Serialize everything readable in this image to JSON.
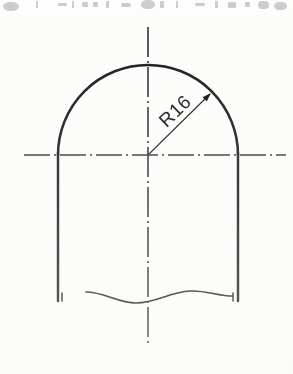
{
  "document": {
    "kind": "engineering-drawing",
    "medium": "scanned-paper",
    "paper_color": "#fdfdfc",
    "ink_color": "#1a1a1a",
    "centerline_color": "#2b2b2b",
    "artifact_color": "#8d8d93"
  },
  "scan_artifact": {
    "description": "cut-off bottom edge of a line of printed text from the page above",
    "visible": true,
    "marks": [
      {
        "x": 3,
        "y": 2,
        "w": 16,
        "h": 9,
        "r": 7
      },
      {
        "x": 36,
        "y": 1,
        "w": 2,
        "h": 7,
        "r": 0
      },
      {
        "x": 58,
        "y": 3,
        "w": 9,
        "h": 3,
        "r": 1
      },
      {
        "x": 72,
        "y": 1,
        "w": 2,
        "h": 7,
        "r": 0
      },
      {
        "x": 82,
        "y": 2,
        "w": 6,
        "h": 5,
        "r": 1
      },
      {
        "x": 93,
        "y": 2,
        "w": 5,
        "h": 5,
        "r": 1
      },
      {
        "x": 106,
        "y": 1,
        "w": 3,
        "h": 7,
        "r": 0
      },
      {
        "x": 121,
        "y": 3,
        "w": 10,
        "h": 4,
        "r": 2
      },
      {
        "x": 141,
        "y": 0,
        "w": 14,
        "h": 9,
        "r": 6
      },
      {
        "x": 160,
        "y": 1,
        "w": 4,
        "h": 7,
        "r": 1
      },
      {
        "x": 176,
        "y": 1,
        "w": 2,
        "h": 7,
        "r": 0
      },
      {
        "x": 195,
        "y": 3,
        "w": 10,
        "h": 3,
        "r": 1
      },
      {
        "x": 215,
        "y": 1,
        "w": 3,
        "h": 7,
        "r": 0
      },
      {
        "x": 228,
        "y": 2,
        "w": 8,
        "h": 6,
        "r": 1
      },
      {
        "x": 245,
        "y": 2,
        "w": 5,
        "h": 5,
        "r": 1
      },
      {
        "x": 258,
        "y": 1,
        "w": 11,
        "h": 8,
        "r": 4
      },
      {
        "x": 274,
        "y": 2,
        "w": 13,
        "h": 8,
        "r": 5
      }
    ]
  },
  "drawing": {
    "title": "Arch-top profile with radius dimension",
    "center_point": {
      "x": 148,
      "y": 155
    },
    "arc": {
      "name": "outer-arc",
      "radius_px": 90,
      "left_x": 58,
      "right_x": 238,
      "apex_y": 58,
      "start_angle_deg": 180,
      "end_angle_deg": 0,
      "stroke_width": 2.6
    },
    "left_wall": {
      "x": 58,
      "y_top": 153,
      "y_bottom": 301,
      "stroke_width": 2.4
    },
    "right_wall": {
      "x": 238,
      "y_top": 153,
      "y_bottom": 301,
      "stroke_width": 2.4
    },
    "break_line": {
      "name": "freehand-break-line",
      "description": "wavy short-break line indicating the part continues below",
      "path": "M 62 293 L 62 301 M 86 292 C 104 292 118 303 136 303 C 156 303 170 292 190 291 C 205 290 218 296 233 296 L 233 301 M 233 301 L 233 293",
      "stroke_width": 1.5
    },
    "horizontal_centerline": {
      "name": "horizontal-centerline",
      "y": 155,
      "x_start": 24,
      "x_end": 286,
      "dash_pattern": "26 4 2 4",
      "stroke_width": 1.3
    },
    "vertical_centerline": {
      "name": "vertical-centerline",
      "x": 148,
      "y_start": 27,
      "y_end": 346,
      "dash_pattern": "30 4 2 4",
      "stroke_width": 1.6
    }
  },
  "dimensions": [
    {
      "id": "radius-dim-1",
      "label": "R16",
      "type": "radius",
      "value": 16,
      "prefix": "R",
      "leader": {
        "from": {
          "x": 149,
          "y": 154
        },
        "to": {
          "x": 209,
          "y": 95
        },
        "angle_deg": -45,
        "stroke_width": 1.1
      },
      "arrowhead": {
        "tip": {
          "x": 211,
          "y": 93
        },
        "size": 9,
        "angle_deg": -45,
        "filled": true
      },
      "text_placement": {
        "x": 176,
        "y": 112,
        "rotation_deg": -44,
        "font_size": 19,
        "letter_spacing": 0.5
      }
    }
  ]
}
